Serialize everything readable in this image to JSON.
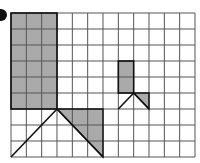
{
  "diagram": {
    "grid": {
      "cols": 12,
      "rows": 9,
      "x0": 11,
      "y0": 13,
      "cell_w": 15.333,
      "cell_h": 16,
      "line_color": "#555555"
    },
    "colors": {
      "fill": "#aaaaaa",
      "stroke": "#111111",
      "background": "#ffffff"
    },
    "bullet": {
      "cx": 1,
      "cy": 15,
      "r": 6
    },
    "large_figure": {
      "rect": {
        "col": 0,
        "row": 0,
        "w": 3,
        "h": 6
      },
      "lines": [
        [
          [
            3,
            6
          ],
          [
            0,
            9
          ]
        ],
        [
          [
            3,
            6
          ],
          [
            6,
            9
          ]
        ]
      ],
      "shaded_triangle": [
        [
          3,
          6
        ],
        [
          6,
          6
        ],
        [
          6,
          9
        ]
      ]
    },
    "small_figure": {
      "rect": {
        "col": 7,
        "row": 3,
        "w": 1,
        "h": 2
      },
      "lines": [
        [
          [
            8,
            5
          ],
          [
            7,
            6
          ]
        ],
        [
          [
            8,
            5
          ],
          [
            9,
            6
          ]
        ]
      ],
      "shaded_triangle": [
        [
          8,
          5
        ],
        [
          9,
          5
        ],
        [
          9,
          6
        ]
      ]
    }
  }
}
